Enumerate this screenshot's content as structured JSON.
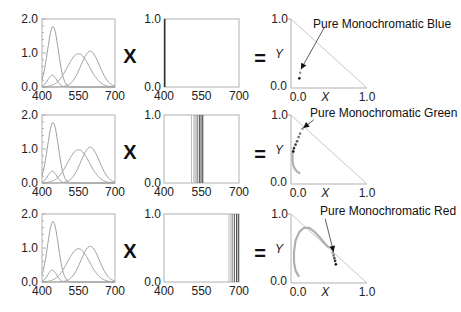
{
  "operators": {
    "times": "X",
    "equals": "="
  },
  "rows": [
    {
      "name": "blue",
      "annotation": "Pure Monochromatic Blue",
      "lines_nm": [
        402,
        404
      ],
      "dots": [
        [
          0.12,
          0.22
        ],
        [
          0.11,
          0.14
        ]
      ],
      "arrow": {
        "from": [
          0.44,
          0.88
        ],
        "to": [
          0.13,
          0.27
        ]
      },
      "locus_gray": []
    },
    {
      "name": "green",
      "annotation": "Pure Monochromatic Green",
      "lines_nm": [
        510,
        520,
        528,
        535,
        542,
        548,
        555
      ],
      "dots": [
        [
          0.15,
          0.8
        ],
        [
          0.12,
          0.73
        ],
        [
          0.1,
          0.68
        ],
        [
          0.08,
          0.62
        ],
        [
          0.06,
          0.57
        ],
        [
          0.04,
          0.52
        ],
        [
          0.03,
          0.47
        ]
      ],
      "arrow": {
        "from": [
          0.3,
          0.93
        ],
        "to": [
          0.16,
          0.81
        ]
      },
      "locus_gray": [
        [
          0.03,
          0.5
        ],
        [
          0.02,
          0.42
        ],
        [
          0.02,
          0.34
        ],
        [
          0.03,
          0.27
        ],
        [
          0.05,
          0.22
        ],
        [
          0.08,
          0.18
        ],
        [
          0.11,
          0.16
        ]
      ]
    },
    {
      "name": "red",
      "annotation": "Pure Monochromatic Red",
      "lines_nm": [
        660,
        668,
        675,
        682,
        690,
        697
      ],
      "dots": [
        [
          0.55,
          0.44
        ],
        [
          0.56,
          0.4
        ],
        [
          0.57,
          0.36
        ],
        [
          0.58,
          0.32
        ],
        [
          0.59,
          0.27
        ]
      ],
      "arrow": {
        "from": [
          0.45,
          0.93
        ],
        "to": [
          0.56,
          0.45
        ]
      },
      "locus_gray": [
        [
          0.1,
          0.1
        ],
        [
          0.06,
          0.18
        ],
        [
          0.04,
          0.3
        ],
        [
          0.04,
          0.45
        ],
        [
          0.06,
          0.62
        ],
        [
          0.11,
          0.74
        ],
        [
          0.17,
          0.8
        ],
        [
          0.24,
          0.8
        ],
        [
          0.31,
          0.74
        ],
        [
          0.38,
          0.66
        ],
        [
          0.44,
          0.58
        ],
        [
          0.49,
          0.52
        ]
      ]
    }
  ],
  "chart_data": [
    {
      "type": "line",
      "title": "Color matching functions (repeated in each row, left column)",
      "xlabel": "",
      "ylabel": "",
      "xlim": [
        400,
        700
      ],
      "ylim": [
        0,
        2.0
      ],
      "xticks": [
        "400",
        "550",
        "700"
      ],
      "yticks": [
        "0.0",
        "1.0",
        "2.0"
      ],
      "series": [
        {
          "name": "z-bar (tall blue peak)",
          "peak_x": 445,
          "peak_y": 1.78,
          "width": 22
        },
        {
          "name": "x-bar short lobe",
          "peak_x": 442,
          "peak_y": 0.35,
          "width": 18
        },
        {
          "name": "y-bar",
          "peak_x": 550,
          "peak_y": 0.98,
          "width": 45
        },
        {
          "name": "x-bar main lobe",
          "peak_x": 598,
          "peak_y": 1.05,
          "width": 38
        }
      ]
    },
    {
      "type": "line",
      "title": "Monochromatic spectra (middle column, vertical lines)",
      "xlim": [
        400,
        700
      ],
      "ylim": [
        0,
        1.0
      ],
      "xticks": [
        "400",
        "550",
        "700"
      ],
      "yticks": [
        "0.0",
        "1.0"
      ],
      "series": [
        {
          "name": "blue",
          "lines_nm": [
            402,
            404
          ]
        },
        {
          "name": "green",
          "lines_nm": [
            510,
            520,
            528,
            535,
            542,
            548,
            555
          ]
        },
        {
          "name": "red",
          "lines_nm": [
            660,
            668,
            675,
            682,
            690,
            697
          ]
        }
      ]
    },
    {
      "type": "scatter",
      "title": "Chromaticity (right column)",
      "xlabel": "X",
      "ylabel": "Y",
      "xlim": [
        0,
        1.0
      ],
      "ylim": [
        0,
        1.0
      ],
      "xticks": [
        "0.0",
        "1.0"
      ],
      "yticks": [
        "0.0",
        "1.0"
      ],
      "annotations": [
        "Pure Monochromatic Blue",
        "Pure Monochromatic Green",
        "Pure Monochromatic Red"
      ]
    }
  ],
  "axes": {
    "left": {
      "xticks": [
        "400",
        "550",
        "700"
      ],
      "yticks": [
        "0.0",
        "1.0",
        "2.0"
      ]
    },
    "middle": {
      "xticks": [
        "400",
        "550",
        "700"
      ],
      "yticks": [
        "0.0",
        "1.0"
      ]
    },
    "right": {
      "xticks": [
        "0.0",
        "1.0"
      ],
      "yticks": [
        "0.0",
        "1.0"
      ],
      "xlabel": "X",
      "ylabel": "Y"
    }
  },
  "colors": {
    "curve": "#a0a0a0",
    "frame": "#b0b0b0",
    "line_dark": "#333333",
    "line_light": "#b8b8b8",
    "text": "#222222"
  }
}
